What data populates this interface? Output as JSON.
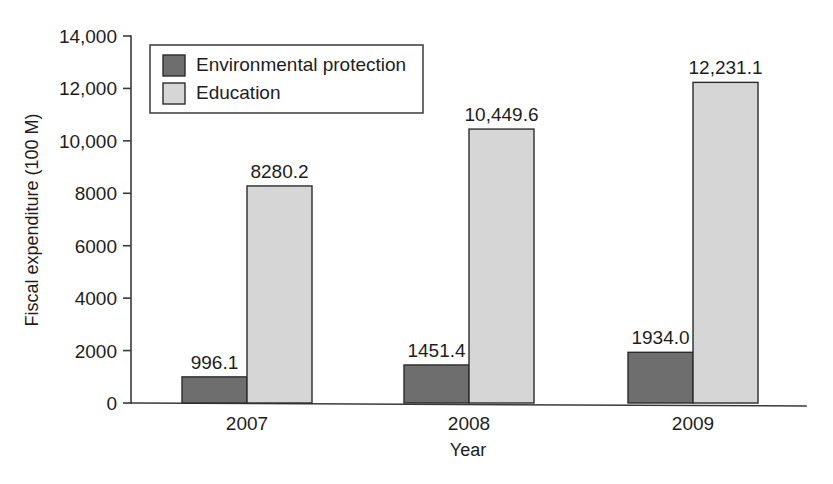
{
  "chart_data": {
    "type": "bar",
    "title": "",
    "xlabel": "Year",
    "ylabel": "Fiscal expenditure (100 M)",
    "categories": [
      "2007",
      "2008",
      "2009"
    ],
    "series": [
      {
        "name": "Environmental protection",
        "color": "#6e6e6e",
        "values": [
          996.1,
          1451.4,
          1934.0
        ],
        "labels": [
          "996.1",
          "1451.4",
          "1934.0"
        ]
      },
      {
        "name": "Education",
        "color": "#d6d6d6",
        "values": [
          8280.2,
          10449.6,
          12231.1
        ],
        "labels": [
          "8280.2",
          "10,449.6",
          "12,231.1"
        ]
      }
    ],
    "ylim": [
      0,
      14000
    ],
    "ytick_values": [
      0,
      2000,
      4000,
      6000,
      8000,
      10000,
      12000,
      14000
    ],
    "ytick_labels": [
      "0",
      "2000",
      "4000",
      "6000",
      "8000",
      "10,000",
      "12,000",
      "14,000"
    ],
    "grid": false,
    "legend_position": "top-left-inside",
    "bar_outline_color": "#2b2b2b",
    "axis_color": "#3a3a3a"
  },
  "legend": {
    "entries": [
      {
        "label": "Environmental protection",
        "color": "#6e6e6e"
      },
      {
        "label": "Education",
        "color": "#d6d6d6"
      }
    ]
  }
}
